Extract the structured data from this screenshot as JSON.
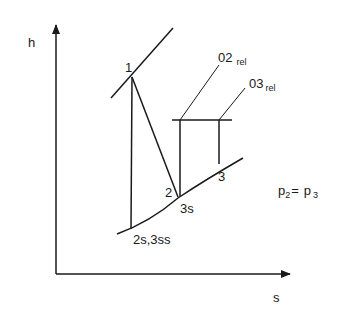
{
  "diagram": {
    "type": "h-s diagram (enthalpy-entropy)",
    "axes": {
      "y_label": "h",
      "x_label": "s"
    },
    "points": [
      {
        "id": "1",
        "label": "1"
      },
      {
        "id": "2",
        "label": "2"
      },
      {
        "id": "3s",
        "label": "3s"
      },
      {
        "id": "3",
        "label": "3"
      },
      {
        "id": "2s3ss",
        "label": "2s,3ss"
      }
    ],
    "stagnation_labels": [
      {
        "id": "02rel",
        "main": "02",
        "sub": "rel"
      },
      {
        "id": "03rel",
        "main": "03",
        "sub": "rel"
      }
    ],
    "equation": {
      "lhs_main": "p",
      "lhs_sub": "2",
      "eq": "=",
      "rhs_main": "p",
      "rhs_sub": "3"
    }
  }
}
